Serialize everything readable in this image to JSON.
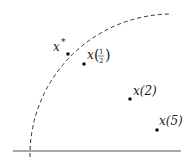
{
  "diagram": {
    "axis": {
      "x1": 13,
      "y": 151,
      "x2": 181,
      "color": "#555555"
    },
    "curve": {
      "style": "dashed",
      "from": [
        30,
        156
      ],
      "to": [
        172,
        14
      ],
      "color": "#333333"
    },
    "points": [
      {
        "id": "x-star",
        "x": 68,
        "y": 54,
        "label": "x",
        "sup": "*"
      },
      {
        "id": "x-half",
        "x": 84,
        "y": 64,
        "label": "x",
        "arg": "1/2"
      },
      {
        "id": "x-2",
        "x": 130,
        "y": 99,
        "label": "x",
        "arg": "2"
      },
      {
        "id": "x-5",
        "x": 157,
        "y": 130,
        "label": "x",
        "arg": "5"
      }
    ],
    "labels": {
      "x_star": "x",
      "x_star_sup": "*",
      "x_half": "x",
      "x_half_num": "1",
      "x_half_den": "2",
      "x_2": "x(2)",
      "x_5": "x(5)"
    }
  }
}
